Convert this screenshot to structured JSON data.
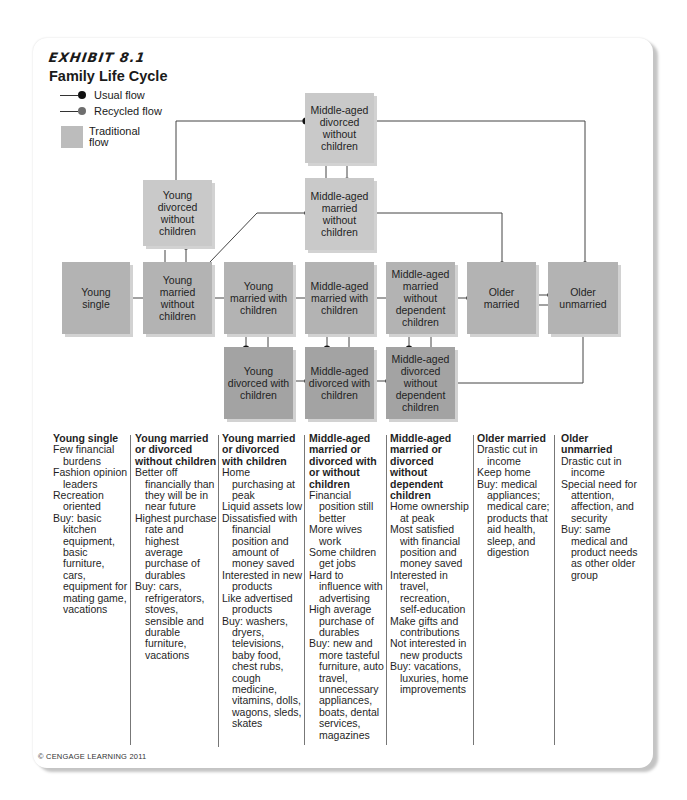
{
  "exhibit": {
    "label": "EXHIBIT 8.1",
    "title": "Family Life Cycle"
  },
  "legend": {
    "usual_flow": "Usual flow",
    "recycled_flow": "Recycled flow",
    "traditional_flow": "Traditional\nflow",
    "colors": {
      "usual_dot": "#111111",
      "recycled_dot": "#6e6e6e",
      "traditional_box": "#bcbcbc"
    }
  },
  "boxes": {
    "young_single": "Young single",
    "young_married_without_children": "Young married without children",
    "young_divorced_without_children": "Young divorced without children",
    "young_married_with_children": "Young married with children",
    "young_divorced_with_children": "Young divorced with children",
    "middle_aged_married_with_children": "Middle-aged married with children",
    "middle_aged_divorced_with_children": "Middle-aged divorced with children",
    "middle_aged_married_without_children": "Middle-aged married without children",
    "middle_aged_divorced_without_children": "Middle-aged divorced without children",
    "middle_aged_married_without_dependent_children": "Middle-aged married without dependent children",
    "middle_aged_divorced_without_dependent_children": "Middle-aged divorced without dependent children",
    "older_married": "Older married",
    "older_unmarried": "Older unmarried"
  },
  "columns": [
    {
      "heading": "Young single",
      "items": [
        "Few financial burdens",
        "Fashion opinion leaders",
        "Recreation oriented",
        "Buy: basic kitchen equipment, basic furniture, cars, equipment for mating game, vacations"
      ]
    },
    {
      "heading": "Young married or divorced without children",
      "items": [
        "Better off financially than they will be in near future",
        "Highest purchase rate and highest average purchase of durables",
        "Buy: cars, refrigerators, stoves, sensible and durable furniture, vacations"
      ]
    },
    {
      "heading": "Young married or divorced with children",
      "items": [
        "Home purchasing at peak",
        "Liquid assets low",
        "Dissatisfied with financial position and amount of money saved",
        "Interested in new products",
        "Like advertised products",
        "Buy: washers, dryers, televisions, baby food, chest rubs, cough medicine, vitamins, dolls, wagons, sleds, skates"
      ]
    },
    {
      "heading": "Middle-aged married or divorced with or without children",
      "items": [
        "Financial position still better",
        "More wives work",
        "Some children get jobs",
        "Hard to influence with advertising",
        "High average purchase of durables",
        "Buy: new and more tasteful furniture, auto travel, unnecessary appliances, boats, dental services, magazines"
      ]
    },
    {
      "heading": "Middle-aged married or divorced without dependent children",
      "items": [
        "Home ownership at peak",
        "Most satisfied with financial position and money saved",
        "Interested in travel, recreation, self-education",
        "Make gifts and contributions",
        "Not interested in new products",
        "Buy: vacations, luxuries, home improvements"
      ]
    },
    {
      "heading": "Older married",
      "items": [
        "Drastic cut in income",
        "Keep home",
        "Buy: medical appliances; medical care; products that aid health, sleep, and digestion"
      ]
    },
    {
      "heading": "Older unmarried",
      "items": [
        "Drastic cut in income",
        "Special need for attention, affection, and security",
        "Buy: same medical and product needs as other older group"
      ]
    }
  ],
  "copyright": "© CENGAGE LEARNING 2011"
}
